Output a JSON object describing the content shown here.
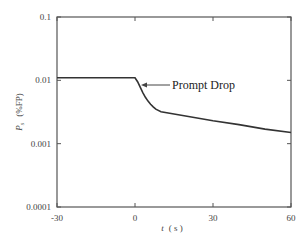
{
  "chart_data": {
    "type": "line",
    "title": "",
    "xlabel": "t ( s )",
    "ylabel": "P_s (%FP)",
    "ylabel_main": "P",
    "ylabel_sub": "s",
    "ylabel_unit": "(%FP)",
    "xlabel_var": "t",
    "xlabel_unit": "( s )",
    "xlim": [
      -30,
      60
    ],
    "ylim": [
      0.0001,
      0.1
    ],
    "yscale": "log",
    "grid": false,
    "legend": null,
    "xticks": [
      -30,
      0,
      30,
      60
    ],
    "xtick_labels": [
      "-30",
      "0",
      "30",
      "60"
    ],
    "yticks": [
      0.0001,
      0.001,
      0.01,
      0.1
    ],
    "ytick_labels": [
      "0.0001",
      "0.001",
      "0.01",
      "0.1"
    ],
    "series": [
      {
        "name": "Power",
        "x": [
          -30,
          0,
          1,
          2,
          3,
          4,
          5,
          6,
          7,
          8,
          10,
          20,
          30,
          40,
          50,
          60
        ],
        "y": [
          0.011,
          0.011,
          0.0095,
          0.0078,
          0.0064,
          0.0054,
          0.0047,
          0.0042,
          0.0038,
          0.0035,
          0.0032,
          0.0027,
          0.0023,
          0.002,
          0.0017,
          0.0015
        ]
      }
    ],
    "annotations": [
      {
        "text": "Prompt Drop",
        "arrow_to": {
          "x": 1,
          "y": 0.0085
        }
      }
    ]
  }
}
